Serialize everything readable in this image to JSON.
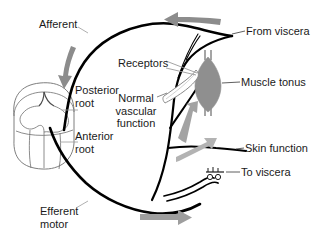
{
  "figure": {
    "type": "anatomical-diagram",
    "background_color": "#ffffff",
    "nerve_color": "#000000",
    "arrow_color": "#8c8c8c",
    "muscle_color": "#8f8f8f",
    "cord_outline_color": "#6b6b6b",
    "leader_color": "#4d4d4d",
    "text_color": "#1a1a1a"
  },
  "labels": {
    "afferent": "Afferent",
    "posterior_root": "Posterior\nroot",
    "posterior_root_line1": "Posterior",
    "posterior_root_line2": "root",
    "anterior_root_line1": "Anterior",
    "anterior_root_line2": "root",
    "efferent_motor_line1": "Efferent",
    "efferent_motor_line2": "motor",
    "receptors": "Receptors",
    "normal_vascular_function_line1": "Normal",
    "normal_vascular_function_line2": "vascular",
    "normal_vascular_function_line3": "function",
    "from_viscera": "From viscera",
    "muscle_tonus": "Muscle tonus",
    "skin_function": "Skin function",
    "to_viscera": "To viscera"
  },
  "parts": {
    "spinal_cord": "spinal-cord-segment",
    "muscle": "skeletal-muscle-spindle",
    "blood_vessel": "blood-vessel",
    "ganglion": "visceral-ganglion"
  },
  "arrows": [
    {
      "name": "arrow-from-viscera-inflow",
      "direction": "left",
      "position": "top"
    },
    {
      "name": "arrow-afferent-downflow",
      "direction": "down",
      "position": "upper-left"
    },
    {
      "name": "arrow-to-muscle",
      "direction": "up-right",
      "position": "middle-right"
    },
    {
      "name": "arrow-to-skin",
      "direction": "right",
      "position": "lower-right"
    },
    {
      "name": "arrow-efferent-outflow",
      "direction": "right",
      "position": "bottom"
    }
  ]
}
